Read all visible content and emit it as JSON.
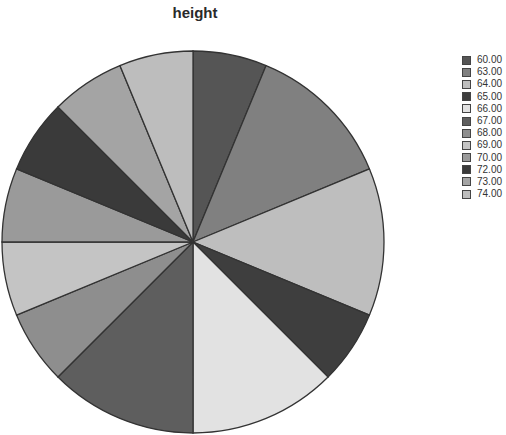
{
  "chart_data": {
    "type": "pie",
    "title": "height",
    "categories": [
      "60.00",
      "63.00",
      "64.00",
      "65.00",
      "66.00",
      "67.00",
      "68.00",
      "69.00",
      "70.00",
      "72.00",
      "73.00",
      "74.00"
    ],
    "values": [
      1,
      2,
      2,
      1,
      2,
      2,
      1,
      1,
      1,
      1,
      1,
      1
    ],
    "percent": [
      6.25,
      12.5,
      12.5,
      6.25,
      12.5,
      12.5,
      6.25,
      6.25,
      6.25,
      6.25,
      6.25,
      6.25
    ],
    "colors": [
      "#555555",
      "#808080",
      "#bebebe",
      "#3e3e3e",
      "#e2e2e2",
      "#5e5e5e",
      "#8e8e8e",
      "#c4c4c4",
      "#9a9a9a",
      "#3a3a3a",
      "#a4a4a4",
      "#bdbdbd"
    ],
    "start_angle_deg": 0,
    "direction": "clockwise",
    "legend_position": "right",
    "xlabel": "",
    "ylabel": ""
  }
}
